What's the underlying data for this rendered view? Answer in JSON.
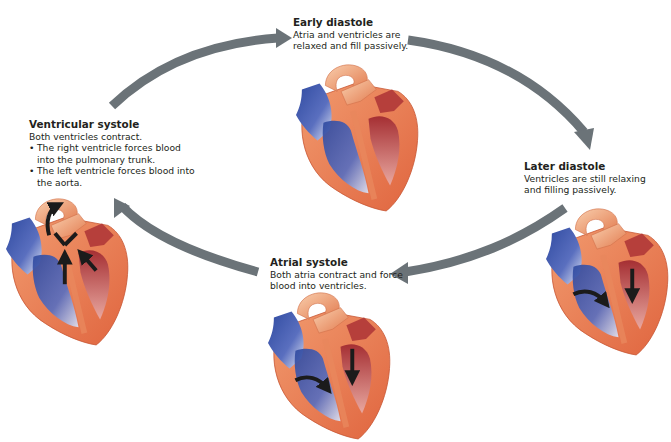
{
  "diagram": {
    "type": "cardiac-cycle",
    "arrow_color": "#6b7378",
    "colors": {
      "heart_wall": "#e8774e",
      "heart_wall_light": "#f4b48f",
      "deoxygenated_blood": "#3c53a3",
      "oxygenated_blood": "#b83a3a",
      "flow_arrow": "#1b1b1b"
    },
    "stages": [
      {
        "id": "early-diastole",
        "title": "Early diastole",
        "description": "Atria and ventricles are relaxed and fill passively."
      },
      {
        "id": "later-diastole",
        "title": "Later diastole",
        "description": "Ventricles are still relaxing and filling passively."
      },
      {
        "id": "atrial-systole",
        "title": "Atrial systole",
        "description": "Both atria contract and force blood into ventricles."
      },
      {
        "id": "ventricular-systole",
        "title": "Ventricular systole",
        "description": "Both ventricles contract.",
        "bullets": [
          "The right ventricle forces blood into the pulmonary trunk.",
          "The left ventricle forces blood into the aorta."
        ]
      }
    ],
    "cycle_arrows": [
      {
        "from": "ventricular-systole",
        "to": "early-diastole"
      },
      {
        "from": "early-diastole",
        "to": "later-diastole"
      },
      {
        "from": "later-diastole",
        "to": "atrial-systole"
      },
      {
        "from": "atrial-systole",
        "to": "ventricular-systole"
      }
    ]
  }
}
